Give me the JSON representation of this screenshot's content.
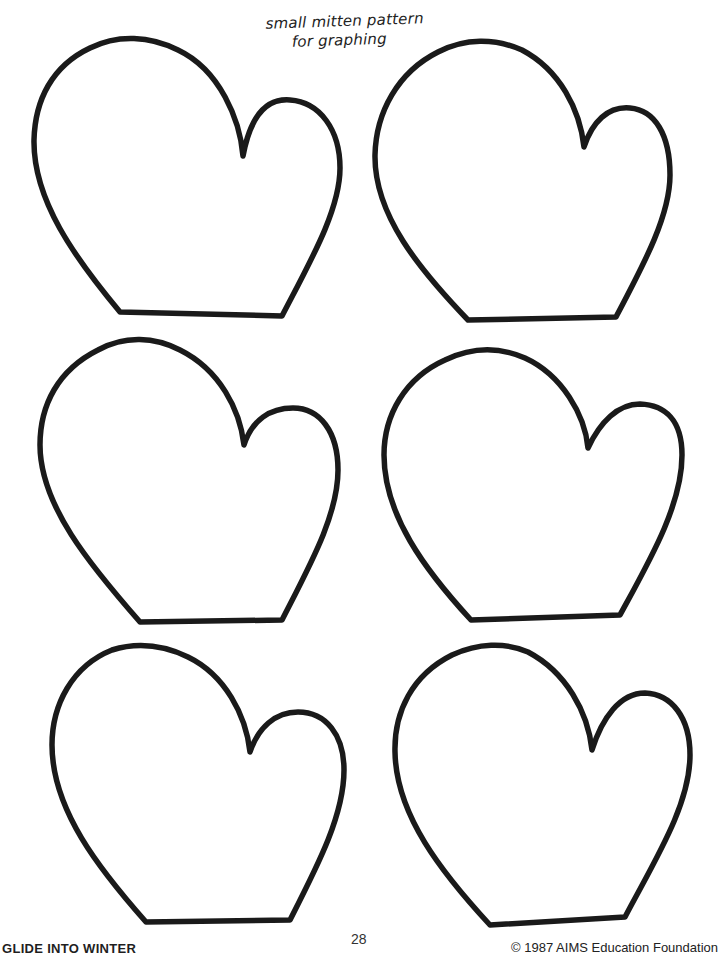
{
  "page": {
    "title_line1": "small mitten pattern",
    "title_line2": "for graphing",
    "background_color": "#ffffff",
    "stroke_color": "#1a1a1a"
  },
  "mittens": [
    {
      "label": "mitten 1",
      "position": "row 1, left"
    },
    {
      "label": "mitten 2",
      "position": "row 1, right"
    },
    {
      "label": "mitten 3",
      "position": "row 2, left"
    },
    {
      "label": "mitten 4",
      "position": "row 2, right"
    },
    {
      "label": "mitten 5",
      "position": "row 3, left"
    },
    {
      "label": "mitten 6",
      "position": "row 3, right"
    }
  ],
  "footer": {
    "book_title": "GLIDE INTO WINTER",
    "page_number": "28",
    "copyright": "© 1987 AIMS Education Foundation"
  }
}
